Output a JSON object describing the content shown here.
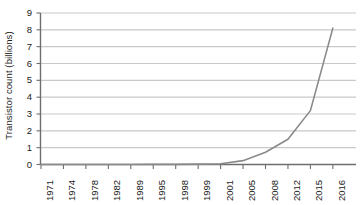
{
  "chart_data": {
    "type": "line",
    "title": "",
    "subtitle": "",
    "xlabel": "",
    "ylabel": "Transistor count (billions)",
    "categories": [
      "1971",
      "1974",
      "1978",
      "1982",
      "1989",
      "1995",
      "1998",
      "1999",
      "2001",
      "2005",
      "2008",
      "2012",
      "2015",
      "2016"
    ],
    "values": [
      0.0,
      0.0,
      0.0,
      0.0,
      0.0,
      0.01,
      0.01,
      0.02,
      0.04,
      0.23,
      0.73,
      1.5,
      3.2,
      8.1
    ],
    "series": [
      {
        "name": "Transistor count",
        "values": [
          0.0,
          0.0,
          0.0,
          0.0,
          0.0,
          0.01,
          0.01,
          0.02,
          0.04,
          0.23,
          0.73,
          1.5,
          3.2,
          8.1
        ]
      }
    ],
    "ylim": [
      0,
      9
    ],
    "ytick_labels": [
      "0",
      "1",
      "2",
      "3",
      "4",
      "5",
      "6",
      "7",
      "8",
      "9"
    ],
    "ytick_values": [
      0,
      1,
      2,
      3,
      4,
      5,
      6,
      7,
      8,
      9
    ],
    "grid": "horizontal",
    "legend": "none",
    "line_color": "#8a8a8a",
    "grid_color": "#c9c9c9",
    "axis_color": "#6e6e6e",
    "text_color": "#1a1a1a",
    "background_color": "#ffffff",
    "xtick_rotation": -90,
    "annotations": []
  }
}
